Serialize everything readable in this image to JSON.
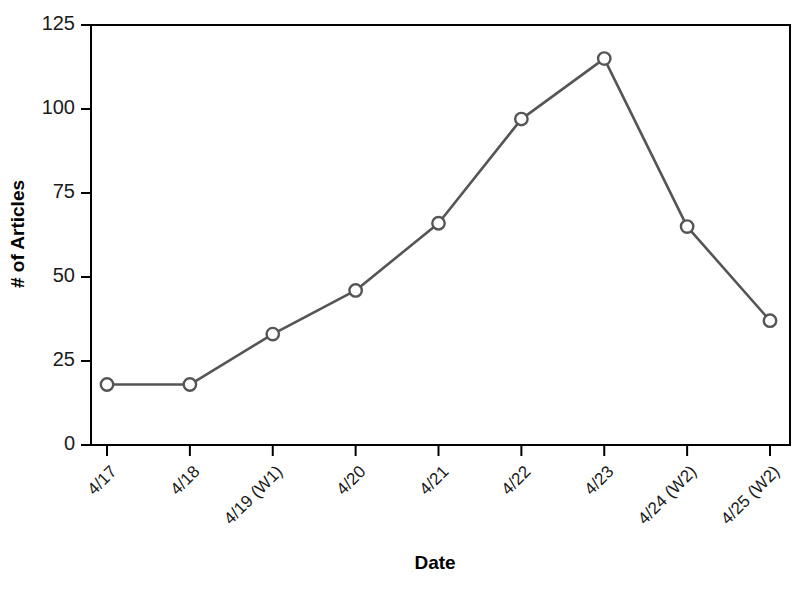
{
  "chart_data": {
    "type": "line",
    "title": "",
    "xlabel": "Date",
    "ylabel": "# of Articles",
    "categories": [
      "4/17",
      "4/18",
      "4/19 (W1)",
      "4/20",
      "4/21",
      "4/22",
      "4/23",
      "4/24 (W2)",
      "4/25 (W2)"
    ],
    "values": [
      18,
      18,
      33,
      46,
      66,
      97,
      115,
      65,
      37
    ],
    "series": [
      {
        "name": "# of Articles",
        "values": [
          18,
          18,
          33,
          46,
          66,
          97,
          115,
          65,
          37
        ]
      }
    ],
    "ylim": [
      0,
      125
    ],
    "yticks": [
      0,
      25,
      50,
      75,
      100,
      125
    ],
    "ytick_labels": [
      "0",
      "25",
      "50",
      "75",
      "100",
      "125"
    ],
    "xtick_labels": [
      "4/17",
      "4/18",
      "4/19 (W1)",
      "4/20",
      "4/21",
      "4/22",
      "4/23",
      "4/24 (W2)",
      "4/25 (W2)"
    ],
    "grid": false,
    "legend": false,
    "legend_position": "none",
    "line_color": "#555555",
    "marker_color": "#555555",
    "marker_fill": "#ffffff",
    "marker_shape": "open-circle",
    "axis_color": "#000000",
    "background_color": "#ffffff",
    "frame": "box",
    "xtick_label_rotation": -45
  }
}
